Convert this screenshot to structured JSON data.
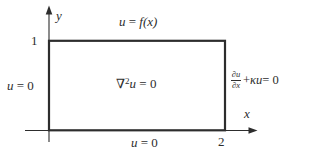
{
  "figure": {
    "background": "#ffffff",
    "ink_color": "#2d2d2d",
    "axes": {
      "x_label": "x",
      "y_label": "y",
      "x_tick": "2",
      "y_tick": "1"
    },
    "equations": {
      "top": {
        "var": "u",
        "op": " = ",
        "expr": "f(x)"
      },
      "left": {
        "var": "u",
        "rest": " = 0"
      },
      "bottom": {
        "var": "u",
        "rest": " = 0"
      },
      "interior": {
        "nabla": "∇",
        "sup": "2",
        "var": "u",
        "rest": " = 0"
      },
      "right": {
        "frac_num": "∂u",
        "frac_den": "∂x",
        "plus": " + ",
        "coef": "κu",
        "rest": " = 0"
      }
    }
  }
}
